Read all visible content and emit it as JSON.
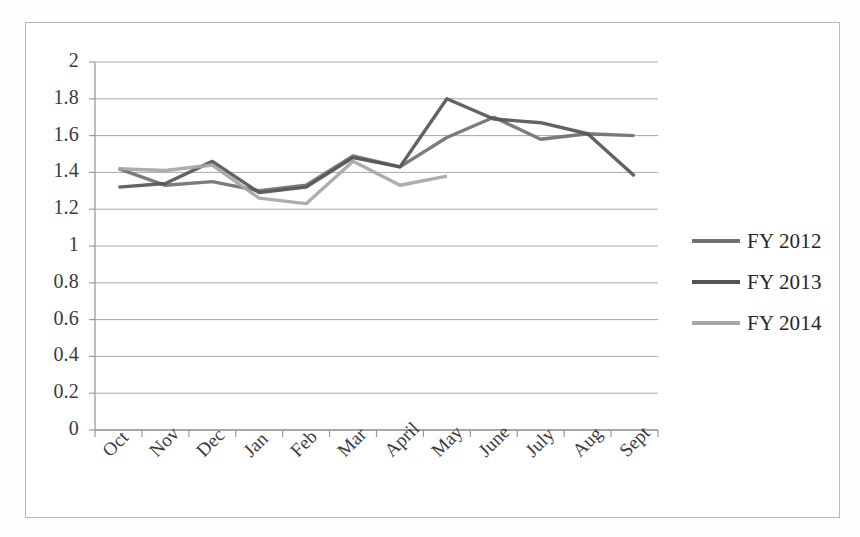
{
  "chart_data": {
    "type": "line",
    "title": "",
    "xlabel": "",
    "ylabel": "",
    "categories": [
      "Oct",
      "Nov",
      "Dec",
      "Jan",
      "Feb",
      "Mar",
      "April",
      "May",
      "June",
      "July",
      "Aug",
      "Sept"
    ],
    "ylim": [
      0,
      2
    ],
    "ytick_labels": [
      "2",
      "1.8",
      "1.6",
      "1.4",
      "1.2",
      "1",
      "0.8",
      "0.6",
      "0.4",
      "0.2",
      "0"
    ],
    "ytick_values": [
      2,
      1.8,
      1.6,
      1.4,
      1.2,
      1,
      0.8,
      0.6,
      0.4,
      0.2,
      0
    ],
    "grid": true,
    "grid_color": "#a8a8a8",
    "legend_position": "right",
    "series": [
      {
        "name": "FY 2012",
        "color": "#717171",
        "values": [
          1.42,
          1.33,
          1.35,
          1.3,
          1.33,
          1.49,
          1.43,
          1.59,
          1.7,
          1.58,
          1.61,
          1.6
        ]
      },
      {
        "name": "FY 2013",
        "color": "#555555",
        "values": [
          1.32,
          1.34,
          1.46,
          1.29,
          1.32,
          1.48,
          1.43,
          1.8,
          1.69,
          1.67,
          1.61,
          1.38
        ]
      },
      {
        "name": "FY 2014",
        "color": "#a6a6a6",
        "values": [
          1.42,
          1.41,
          1.44,
          1.26,
          1.23,
          1.46,
          1.33,
          1.38,
          null,
          null,
          null,
          null
        ]
      }
    ]
  },
  "legend": {
    "items": [
      {
        "label": "FY 2012",
        "color": "#717171"
      },
      {
        "label": "FY 2013",
        "color": "#555555"
      },
      {
        "label": "FY 2014",
        "color": "#a6a6a6"
      }
    ]
  }
}
